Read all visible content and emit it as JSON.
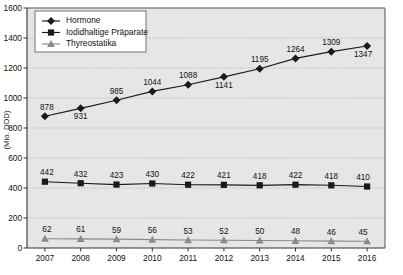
{
  "chart_data": {
    "type": "line",
    "title": "",
    "subtitle": "",
    "xlabel": "",
    "ylabel": "(Mio. DDD)",
    "categories": [
      "2007",
      "2008",
      "2009",
      "2010",
      "2011",
      "2012",
      "2013",
      "2014",
      "2015",
      "2016"
    ],
    "ylim": [
      0,
      1600
    ],
    "ytick_step": 200,
    "yticks": [
      "0",
      "200",
      "400",
      "600",
      "800",
      "1000",
      "1200",
      "1400",
      "1600"
    ],
    "grid": true,
    "legend_position": "top-left",
    "series": [
      {
        "name": "Hormone",
        "marker": "diamond",
        "color": "#1a1a1a",
        "values": [
          878,
          931,
          985,
          1044,
          1088,
          1141,
          1195,
          1264,
          1309,
          1347
        ],
        "labels": [
          "878",
          "931",
          "985",
          "1044",
          "1088",
          "1141",
          "1195",
          "1264",
          "1309",
          "1347"
        ],
        "label_placement": [
          "above",
          "below",
          "above",
          "above",
          "above",
          "below",
          "above",
          "above",
          "above",
          "below"
        ]
      },
      {
        "name": "Iodidhaltige Präparate",
        "marker": "square",
        "color": "#1a1a1a",
        "values": [
          442,
          432,
          423,
          430,
          422,
          421,
          418,
          422,
          418,
          410
        ],
        "labels": [
          "442",
          "432",
          "423",
          "430",
          "422",
          "421",
          "418",
          "422",
          "418",
          "410"
        ],
        "label_placement": [
          "above",
          "above",
          "above",
          "above",
          "above",
          "above",
          "above",
          "above",
          "above",
          "above"
        ]
      },
      {
        "name": "Thyreostatika",
        "marker": "triangle",
        "color": "#8a8a8a",
        "values": [
          62,
          61,
          59,
          56,
          53,
          52,
          50,
          48,
          46,
          45
        ],
        "labels": [
          "62",
          "61",
          "59",
          "56",
          "53",
          "52",
          "50",
          "48",
          "46",
          "45"
        ],
        "label_placement": [
          "above",
          "above",
          "above",
          "above",
          "above",
          "above",
          "above",
          "above",
          "above",
          "above"
        ]
      }
    ]
  },
  "style": {
    "plot_background": "#e6e6e6",
    "grid_color": "#9a9a9a",
    "axis_color": "#333333",
    "legend_background": "#ffffff",
    "legend_border": "#666666"
  }
}
